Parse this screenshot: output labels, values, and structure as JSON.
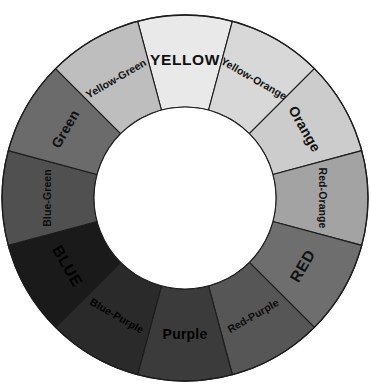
{
  "diagram": {
    "type": "color-wheel",
    "segment_count": 12,
    "geometry": {
      "center_x": 185,
      "center_y": 198,
      "outer_radius": 183,
      "inner_radius": 91,
      "label_radius": 137,
      "start_angle_deg": -105,
      "segment_span_deg": 30
    },
    "outline_color": "#1c1c1c",
    "hub_color": "#ffffff",
    "background_color": "#ffffff",
    "segments": [
      {
        "label": "YELLOW",
        "order": 1,
        "category": "primary",
        "fill": "#e9e9e9",
        "text_color": "#101010",
        "angle_center_deg": -90
      },
      {
        "label": "Yellow-Orange",
        "order": 2,
        "category": "tertiary",
        "fill": "#d8d8d8",
        "text_color": "#101010",
        "angle_center_deg": -60
      },
      {
        "label": "Orange",
        "order": 3,
        "category": "secondary",
        "fill": "#cccccc",
        "text_color": "#101010",
        "angle_center_deg": -30
      },
      {
        "label": "Red-Orange",
        "order": 4,
        "category": "tertiary",
        "fill": "#a3a3a3",
        "text_color": "#101010",
        "angle_center_deg": 0
      },
      {
        "label": "RED",
        "order": 5,
        "category": "primary",
        "fill": "#6e6e6e",
        "text_color": "#101010",
        "angle_center_deg": 30
      },
      {
        "label": "Red-Purple",
        "order": 6,
        "category": "tertiary",
        "fill": "#565656",
        "text_color": "#0d0d0d",
        "angle_center_deg": 60
      },
      {
        "label": "Purple",
        "order": 7,
        "category": "secondary",
        "fill": "#3b3b3b",
        "text_color": "#000000",
        "angle_center_deg": 90
      },
      {
        "label": "Blue-Purple",
        "order": 8,
        "category": "tertiary",
        "fill": "#2a2a2a",
        "text_color": "#000000",
        "angle_center_deg": 120
      },
      {
        "label": "BLUE",
        "order": 9,
        "category": "primary",
        "fill": "#1a1a1a",
        "text_color": "#000000",
        "angle_center_deg": 150
      },
      {
        "label": "Blue-Green",
        "order": 10,
        "category": "tertiary",
        "fill": "#505050",
        "text_color": "#0d0d0d",
        "angle_center_deg": 180
      },
      {
        "label": "Green",
        "order": 11,
        "category": "secondary",
        "fill": "#6b6b6b",
        "text_color": "#101010",
        "angle_center_deg": 210
      },
      {
        "label": "Yellow-Green",
        "order": 12,
        "category": "tertiary",
        "fill": "#bebebe",
        "text_color": "#101010",
        "angle_center_deg": 240
      }
    ]
  }
}
